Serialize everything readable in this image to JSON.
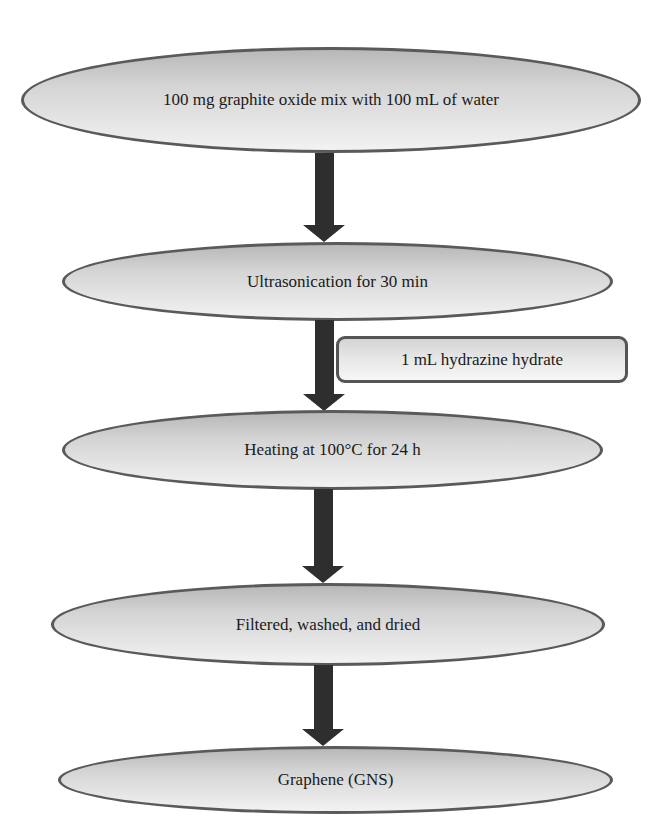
{
  "diagram": {
    "type": "flowchart",
    "direction": "top-to-bottom",
    "colors": {
      "node_border": "#5a5a5a",
      "node_fill_top": "#b8b8b8",
      "node_fill_bottom": "#f2f2f2",
      "arrow": "#2e2e2e",
      "text": "#1a1a1a"
    },
    "steps": [
      {
        "id": "step-1",
        "label": "100 mg graphite oxide mix with 100 mL of water"
      },
      {
        "id": "step-2",
        "label": "Ultrasonication for 30 min"
      },
      {
        "id": "step-3",
        "label": "Heating at 100°C for 24 h"
      },
      {
        "id": "step-4",
        "label": "Filtered, washed, and dried"
      },
      {
        "id": "step-5",
        "label": "Graphene (GNS)"
      }
    ],
    "side_inputs": [
      {
        "id": "reagent-1",
        "label": "1 mL hydrazine hydrate",
        "attached_to_arrow": "step-2 → step-3"
      }
    ],
    "edges": [
      {
        "from": "step-1",
        "to": "step-2"
      },
      {
        "from": "step-2",
        "to": "step-3"
      },
      {
        "from": "step-3",
        "to": "step-4"
      },
      {
        "from": "step-4",
        "to": "step-5"
      }
    ]
  }
}
